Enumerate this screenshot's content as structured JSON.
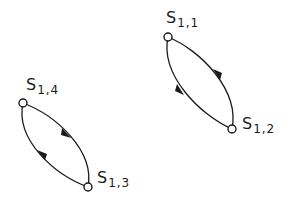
{
  "diagram": {
    "type": "state-cycles",
    "colors": {
      "stroke": "#1a1a1a",
      "background": "#ffffff"
    },
    "nodes": [
      {
        "id": "s11",
        "symbol": "S",
        "subscript": "1,1",
        "x": 168,
        "y": 37,
        "label_x": 166,
        "label_y": 10
      },
      {
        "id": "s12",
        "symbol": "S",
        "subscript": "1,2",
        "x": 232,
        "y": 129,
        "label_x": 242,
        "label_y": 116
      },
      {
        "id": "s13",
        "symbol": "S",
        "subscript": "1,3",
        "x": 88,
        "y": 187,
        "label_x": 97,
        "label_y": 170
      },
      {
        "id": "s14",
        "symbol": "S",
        "subscript": "1,4",
        "x": 23,
        "y": 103,
        "label_x": 26,
        "label_y": 77
      }
    ],
    "edges": [
      {
        "from": "s11",
        "to": "s12",
        "side": "left"
      },
      {
        "from": "s12",
        "to": "s11",
        "side": "right"
      },
      {
        "from": "s14",
        "to": "s13",
        "side": "right"
      },
      {
        "from": "s13",
        "to": "s14",
        "side": "left"
      }
    ]
  }
}
